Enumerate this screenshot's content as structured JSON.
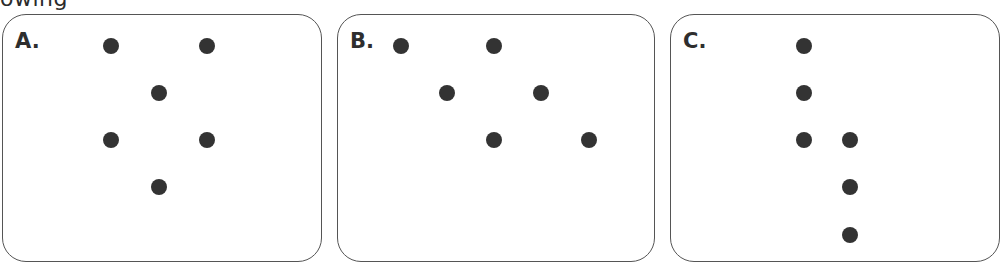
{
  "caption": {
    "visible_text": "owing"
  },
  "colors": {
    "dot": "#333333",
    "border": "#555555",
    "label": "#2e2e2e",
    "background": "#ffffff"
  },
  "panels": [
    {
      "label": "A.",
      "box": {
        "left": 2,
        "top": 14,
        "width": 320,
        "height": 248
      },
      "dots": [
        {
          "x": 111,
          "y": 46
        },
        {
          "x": 207,
          "y": 46
        },
        {
          "x": 159,
          "y": 93
        },
        {
          "x": 111,
          "y": 140
        },
        {
          "x": 207,
          "y": 140
        },
        {
          "x": 159,
          "y": 187
        }
      ]
    },
    {
      "label": "B.",
      "box": {
        "left": 337,
        "top": 14,
        "width": 318,
        "height": 248
      },
      "dots": [
        {
          "x": 401,
          "y": 46
        },
        {
          "x": 494,
          "y": 46
        },
        {
          "x": 447,
          "y": 93
        },
        {
          "x": 541,
          "y": 93
        },
        {
          "x": 494,
          "y": 140
        },
        {
          "x": 589,
          "y": 140
        }
      ]
    },
    {
      "label": "C.",
      "box": {
        "left": 670,
        "top": 14,
        "width": 330,
        "height": 248
      },
      "dots": [
        {
          "x": 804,
          "y": 46
        },
        {
          "x": 804,
          "y": 93
        },
        {
          "x": 804,
          "y": 140
        },
        {
          "x": 850,
          "y": 140
        },
        {
          "x": 850,
          "y": 187
        },
        {
          "x": 850,
          "y": 235
        }
      ]
    }
  ]
}
